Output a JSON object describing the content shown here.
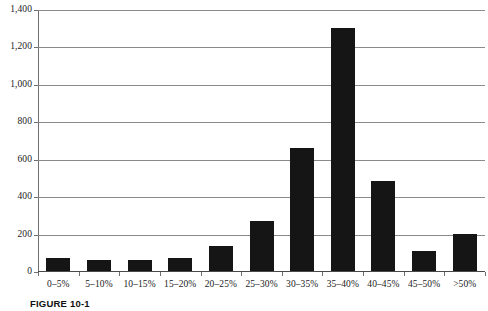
{
  "chart_data": {
    "type": "bar",
    "title": "",
    "xlabel": "",
    "ylabel": "",
    "ylim": [
      0,
      1400
    ],
    "grid": true,
    "legend": "none",
    "bar_color": "#151515",
    "categories": [
      "0–5%",
      "5–10%",
      "10–15%",
      "15–20%",
      "20–25%",
      "25–30%",
      "30–35%",
      "35–40%",
      "40–45%",
      "45–50%",
      ">50%"
    ],
    "values": [
      70,
      60,
      60,
      70,
      135,
      265,
      655,
      1300,
      480,
      105,
      200
    ],
    "ytick_labels": [
      "1,400",
      "1,200",
      "1,000",
      "800",
      "600",
      "400",
      "200",
      "0"
    ],
    "ytick_values": [
      1400,
      1200,
      1000,
      800,
      600,
      400,
      200,
      0
    ]
  },
  "caption": {
    "figure_number": "FIGURE 10-1",
    "text": ""
  }
}
